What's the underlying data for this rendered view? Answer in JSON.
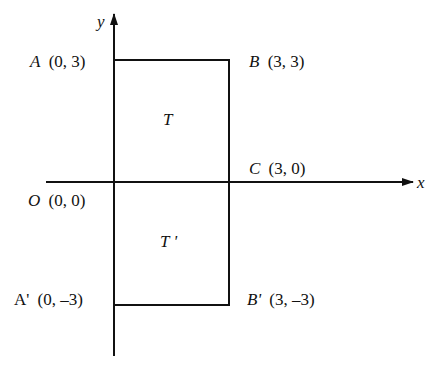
{
  "diagram": {
    "type": "coordinate-reflection",
    "axes": {
      "x_label": "x",
      "y_label": "y"
    },
    "points": {
      "A": {
        "name": "A",
        "coords": "(0, 3)"
      },
      "B": {
        "name": "B",
        "coords": "(3, 3)"
      },
      "C": {
        "name": "C",
        "coords": "(3, 0)"
      },
      "O": {
        "name": "O",
        "coords": "(0, 0)"
      },
      "A_prime": {
        "name": "A'",
        "coords": "(0, –3)"
      },
      "B_prime": {
        "name": "B'",
        "coords": "(3, –3)"
      }
    },
    "regions": {
      "T": "T",
      "T_prime": "T '"
    },
    "colors": {
      "ink": "#111111",
      "background": "#ffffff"
    }
  }
}
